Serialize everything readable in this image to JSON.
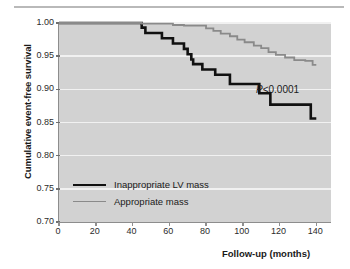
{
  "figure": {
    "background": "#ffffff",
    "plot_background": "#d2d2d2",
    "gridline_color": "#f1f1f1",
    "top_rule_color": "#b9b9b9"
  },
  "annotations": {
    "p_value_prefix": "P",
    "p_value_rest": "<0.0001"
  },
  "legend": {
    "items": [
      {
        "label": "Inappropriate LV mass",
        "color": "#111111",
        "width": "thick"
      },
      {
        "label": "Appropriate mass",
        "color": "#8a8a8a",
        "width": "thin"
      }
    ]
  },
  "chart_data": {
    "type": "line",
    "subtype": "kaplan-meier-step",
    "title": "",
    "xlabel": "Follow-up (months)",
    "ylabel": "Cumulative event-free survival",
    "xlim": [
      0,
      148
    ],
    "ylim": [
      0.7,
      1.0
    ],
    "xticks": [
      0,
      20,
      40,
      60,
      80,
      100,
      120,
      140
    ],
    "xtick_labels": [
      "0",
      "20",
      "40",
      "60",
      "80",
      "100",
      "120",
      "140"
    ],
    "yticks": [
      0.7,
      0.75,
      0.8,
      0.85,
      0.9,
      0.95,
      1.0
    ],
    "ytick_labels": [
      "0.70",
      "0.75",
      "0.80",
      "0.85",
      "0.90",
      "0.95",
      "1.00"
    ],
    "grid": "horizontal",
    "legend_position": "lower-left-inside",
    "annotation": "P<0.0001",
    "series": [
      {
        "name": "Inappropriate LV mass",
        "color": "#111111",
        "linewidth": 2.6,
        "points": [
          [
            0,
            1.0
          ],
          [
            45,
            1.0
          ],
          [
            45,
            0.993
          ],
          [
            47,
            0.993
          ],
          [
            47,
            0.985
          ],
          [
            56,
            0.985
          ],
          [
            56,
            0.977
          ],
          [
            62,
            0.977
          ],
          [
            62,
            0.969
          ],
          [
            68,
            0.969
          ],
          [
            68,
            0.961
          ],
          [
            70,
            0.961
          ],
          [
            70,
            0.953
          ],
          [
            72,
            0.953
          ],
          [
            72,
            0.945
          ],
          [
            73,
            0.945
          ],
          [
            73,
            0.938
          ],
          [
            78,
            0.938
          ],
          [
            78,
            0.93
          ],
          [
            85,
            0.93
          ],
          [
            85,
            0.922
          ],
          [
            93,
            0.922
          ],
          [
            93,
            0.908
          ],
          [
            109,
            0.908
          ],
          [
            109,
            0.894
          ],
          [
            115,
            0.894
          ],
          [
            115,
            0.877
          ],
          [
            137,
            0.877
          ],
          [
            137,
            0.856
          ],
          [
            140,
            0.856
          ]
        ]
      },
      {
        "name": "Appropriate mass",
        "color": "#8a8a8a",
        "linewidth": 1.8,
        "points": [
          [
            0,
            1.0
          ],
          [
            45,
            1.0
          ],
          [
            45,
            0.999
          ],
          [
            62,
            0.999
          ],
          [
            62,
            0.997
          ],
          [
            68,
            0.997
          ],
          [
            68,
            0.996
          ],
          [
            80,
            0.996
          ],
          [
            80,
            0.992
          ],
          [
            84,
            0.992
          ],
          [
            84,
            0.988
          ],
          [
            88,
            0.988
          ],
          [
            88,
            0.984
          ],
          [
            93,
            0.984
          ],
          [
            93,
            0.98
          ],
          [
            97,
            0.98
          ],
          [
            97,
            0.975
          ],
          [
            101,
            0.975
          ],
          [
            101,
            0.971
          ],
          [
            106,
            0.971
          ],
          [
            106,
            0.966
          ],
          [
            110,
            0.966
          ],
          [
            110,
            0.962
          ],
          [
            114,
            0.962
          ],
          [
            114,
            0.956
          ],
          [
            118,
            0.956
          ],
          [
            118,
            0.952
          ],
          [
            123,
            0.952
          ],
          [
            123,
            0.948
          ],
          [
            128,
            0.948
          ],
          [
            128,
            0.944
          ],
          [
            134,
            0.944
          ],
          [
            134,
            0.943
          ],
          [
            138,
            0.943
          ],
          [
            138,
            0.937
          ],
          [
            140,
            0.937
          ]
        ]
      }
    ]
  }
}
